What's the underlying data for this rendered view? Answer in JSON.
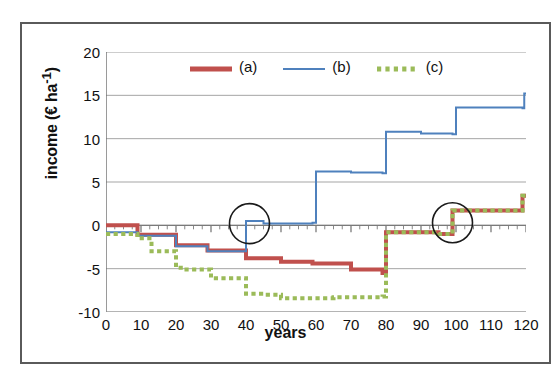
{
  "figure": {
    "x_axis_title": "years",
    "y_axis_title_prefix": "income (€ ha",
    "y_axis_title_sup": "-1",
    "y_axis_title_suffix": ")",
    "y_axis_title_full": "income (€ ha-1)"
  },
  "legend": {
    "items": [
      {
        "label": "(a)",
        "color": "#c0504d",
        "style": "solid-thick",
        "swatch_name": "legend-swatch-a"
      },
      {
        "label": "(b)",
        "color": "#4f81bd",
        "style": "solid-thin",
        "swatch_name": "legend-swatch-b"
      },
      {
        "label": "(c)",
        "color": "#9bbb59",
        "style": "dotted-thick",
        "swatch_name": "legend-swatch-c"
      }
    ]
  },
  "annotations": [
    {
      "name": "highlight-circle-year-40",
      "cx_year": 41,
      "cy_value": 0.2,
      "r_px": 20
    },
    {
      "name": "highlight-circle-year-99",
      "cx_year": 99,
      "cy_value": 0.3,
      "r_px": 20
    }
  ],
  "chart_data": {
    "type": "line",
    "title": "",
    "subtitle": "",
    "xlabel": "years",
    "ylabel": "income (€ ha-1)",
    "xlim": [
      0,
      120
    ],
    "ylim": [
      -10,
      20
    ],
    "x_ticks": [
      0,
      10,
      20,
      30,
      40,
      50,
      60,
      70,
      80,
      90,
      100,
      110,
      120
    ],
    "y_ticks": [
      -10,
      -5,
      0,
      5,
      10,
      15,
      20
    ],
    "x_minor_tick_step": 2.5,
    "y_minor_tick_step": 1,
    "grid": "horizontal-major",
    "legend_position": "top-center",
    "series": [
      {
        "name": "(a)",
        "color": "#c0504d",
        "line_style": "solid",
        "line_width": 4,
        "step": "post",
        "points": [
          {
            "x": 0,
            "y": 0.0
          },
          {
            "x": 9,
            "y": 0.0
          },
          {
            "x": 9,
            "y": -1.1
          },
          {
            "x": 20,
            "y": -1.1
          },
          {
            "x": 20,
            "y": -2.3
          },
          {
            "x": 29,
            "y": -2.3
          },
          {
            "x": 29,
            "y": -2.9
          },
          {
            "x": 40,
            "y": -2.9
          },
          {
            "x": 40,
            "y": -3.8
          },
          {
            "x": 50,
            "y": -3.8
          },
          {
            "x": 50,
            "y": -4.2
          },
          {
            "x": 59,
            "y": -4.2
          },
          {
            "x": 59,
            "y": -4.4
          },
          {
            "x": 70,
            "y": -4.4
          },
          {
            "x": 70,
            "y": -5.1
          },
          {
            "x": 79,
            "y": -5.1
          },
          {
            "x": 79,
            "y": -5.5
          },
          {
            "x": 80,
            "y": -5.5
          },
          {
            "x": 80,
            "y": -0.8
          },
          {
            "x": 95,
            "y": -0.8
          },
          {
            "x": 95,
            "y": -1.0
          },
          {
            "x": 99,
            "y": -1.0
          },
          {
            "x": 99,
            "y": 1.7
          },
          {
            "x": 119,
            "y": 1.7
          },
          {
            "x": 119,
            "y": 3.4
          },
          {
            "x": 120,
            "y": 3.4
          }
        ]
      },
      {
        "name": "(b)",
        "color": "#4f81bd",
        "line_style": "solid",
        "line_width": 2,
        "step": "post",
        "points": [
          {
            "x": 0,
            "y": -0.8
          },
          {
            "x": 9,
            "y": -0.8
          },
          {
            "x": 9,
            "y": -1.2
          },
          {
            "x": 20,
            "y": -1.2
          },
          {
            "x": 20,
            "y": -2.4
          },
          {
            "x": 29,
            "y": -2.4
          },
          {
            "x": 29,
            "y": -3.0
          },
          {
            "x": 40,
            "y": -3.0
          },
          {
            "x": 40,
            "y": 0.5
          },
          {
            "x": 45,
            "y": 0.5
          },
          {
            "x": 45,
            "y": 0.2
          },
          {
            "x": 59,
            "y": 0.2
          },
          {
            "x": 59,
            "y": 0.3
          },
          {
            "x": 60,
            "y": 0.3
          },
          {
            "x": 60,
            "y": 6.2
          },
          {
            "x": 70,
            "y": 6.2
          },
          {
            "x": 70,
            "y": 6.1
          },
          {
            "x": 79,
            "y": 6.1
          },
          {
            "x": 79,
            "y": 6.0
          },
          {
            "x": 80,
            "y": 6.0
          },
          {
            "x": 80,
            "y": 10.8
          },
          {
            "x": 90,
            "y": 10.8
          },
          {
            "x": 90,
            "y": 10.6
          },
          {
            "x": 99,
            "y": 10.6
          },
          {
            "x": 99,
            "y": 10.5
          },
          {
            "x": 100,
            "y": 10.5
          },
          {
            "x": 100,
            "y": 13.6
          },
          {
            "x": 119,
            "y": 13.6
          },
          {
            "x": 119,
            "y": 13.5
          },
          {
            "x": 119.5,
            "y": 13.5
          },
          {
            "x": 119.5,
            "y": 15.2
          },
          {
            "x": 120,
            "y": 15.2
          }
        ]
      },
      {
        "name": "(c)",
        "color": "#9bbb59",
        "line_style": "dotted",
        "line_width": 4,
        "step": "post",
        "points": [
          {
            "x": 0,
            "y": -1.0
          },
          {
            "x": 9,
            "y": -1.0
          },
          {
            "x": 9,
            "y": -1.5
          },
          {
            "x": 13,
            "y": -1.5
          },
          {
            "x": 13,
            "y": -3.0
          },
          {
            "x": 20,
            "y": -3.0
          },
          {
            "x": 20,
            "y": -4.9
          },
          {
            "x": 22,
            "y": -4.9
          },
          {
            "x": 22,
            "y": -5.1
          },
          {
            "x": 30,
            "y": -5.1
          },
          {
            "x": 30,
            "y": -6.1
          },
          {
            "x": 40,
            "y": -6.1
          },
          {
            "x": 40,
            "y": -7.9
          },
          {
            "x": 45,
            "y": -7.9
          },
          {
            "x": 45,
            "y": -8.0
          },
          {
            "x": 50,
            "y": -8.0
          },
          {
            "x": 50,
            "y": -8.4
          },
          {
            "x": 65,
            "y": -8.4
          },
          {
            "x": 65,
            "y": -8.3
          },
          {
            "x": 79,
            "y": -8.3
          },
          {
            "x": 79,
            "y": -8.2
          },
          {
            "x": 80,
            "y": -8.2
          },
          {
            "x": 80,
            "y": -0.8
          },
          {
            "x": 95,
            "y": -0.8
          },
          {
            "x": 95,
            "y": -1.0
          },
          {
            "x": 99,
            "y": -1.0
          },
          {
            "x": 99,
            "y": 1.7
          },
          {
            "x": 119,
            "y": 1.7
          },
          {
            "x": 119,
            "y": 3.4
          },
          {
            "x": 120,
            "y": 3.4
          }
        ]
      }
    ]
  }
}
